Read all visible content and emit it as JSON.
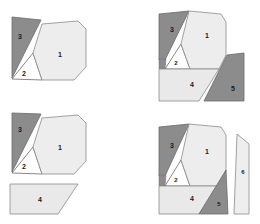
{
  "figure": {
    "type": "geometric-dissection-diagram",
    "background_color": "#ffffff",
    "colors": {
      "light_fill": "#eeeeee",
      "light_fill_alt": "#e8e8e8",
      "dark_fill": "#8c8c8c",
      "dark_fill_alt": "#9a9a9a",
      "white_fill": "#ffffff",
      "outline": "#666666",
      "label_text": "#1a1a1a"
    },
    "panels": [
      {
        "id": "panel-top-left",
        "position": "top-left",
        "piece_count": 3,
        "pieces": [
          {
            "label": "1",
            "shade": "light",
            "label_x": 60,
            "label_y": 55
          },
          {
            "label": "2",
            "shade": "white",
            "label_x": 24,
            "label_y": 74
          },
          {
            "label": "3",
            "shade": "dark",
            "label_x": 20,
            "label_y": 37
          }
        ]
      },
      {
        "id": "panel-top-right",
        "position": "top-right",
        "piece_count": 5,
        "pieces": [
          {
            "label": "1",
            "shade": "light",
            "label_x": 207,
            "label_y": 36
          },
          {
            "label": "2",
            "shade": "white",
            "label_x": 176,
            "label_y": 63
          },
          {
            "label": "3",
            "shade": "dark",
            "label_x": 172,
            "label_y": 30
          },
          {
            "label": "4",
            "shade": "light",
            "label_x": 192,
            "label_y": 85
          },
          {
            "label": "5",
            "shade": "dark",
            "label_x": 233,
            "label_y": 89
          }
        ]
      },
      {
        "id": "panel-bottom-left",
        "position": "bottom-left",
        "piece_count": 4,
        "pieces": [
          {
            "label": "1",
            "shade": "light",
            "label_x": 60,
            "label_y": 148
          },
          {
            "label": "2",
            "shade": "white",
            "label_x": 24,
            "label_y": 167
          },
          {
            "label": "3",
            "shade": "dark",
            "label_x": 20,
            "label_y": 130
          },
          {
            "label": "4",
            "shade": "light",
            "label_x": 40,
            "label_y": 200
          }
        ]
      },
      {
        "id": "panel-bottom-right",
        "position": "bottom-right",
        "piece_count": 6,
        "pieces": [
          {
            "label": "1",
            "shade": "light",
            "label_x": 207,
            "label_y": 152
          },
          {
            "label": "2",
            "shade": "white",
            "label_x": 176,
            "label_y": 180
          },
          {
            "label": "3",
            "shade": "dark",
            "label_x": 172,
            "label_y": 146
          },
          {
            "label": "4",
            "shade": "light",
            "label_x": 192,
            "label_y": 199
          },
          {
            "label": "5",
            "shade": "dark",
            "label_x": 219,
            "label_y": 204
          },
          {
            "label": "6",
            "shade": "light",
            "label_x": 243,
            "label_y": 172
          }
        ]
      }
    ]
  }
}
